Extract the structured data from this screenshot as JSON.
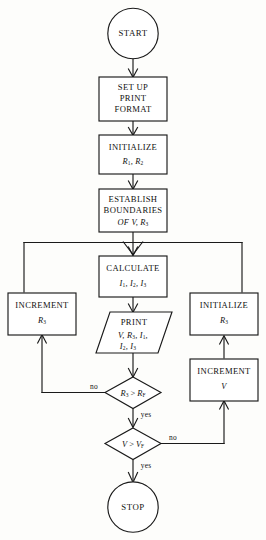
{
  "diagram": {
    "type": "flowchart",
    "stroke_color": "#1a1a1a",
    "fill_color": "#ffffff",
    "background_color": "#fdfdfb"
  },
  "nodes": {
    "start": {
      "shape": "terminal-circle",
      "label": "START"
    },
    "setup": {
      "shape": "process-rect",
      "line1": "SET UP",
      "line2": "PRINT",
      "line3": "FORMAT"
    },
    "initialize_r1_r2": {
      "shape": "process-rect",
      "line1": "INITIALIZE",
      "line2_prefix": "R",
      "line2_sub1": "1",
      "line2_mid": ", R",
      "line2_sub2": "2"
    },
    "establish": {
      "shape": "process-rect",
      "line1": "ESTABLISH",
      "line2": "BOUNDARIES",
      "line3_prefix": "OF V, R",
      "line3_sub": "3"
    },
    "calculate": {
      "shape": "process-rect",
      "line1": "CALCULATE",
      "line2_a": "I",
      "line2_a_sub": "1",
      "line2_b": ", I",
      "line2_b_sub": "2",
      "line2_c": ", I",
      "line2_c_sub": "3"
    },
    "print": {
      "shape": "parallelogram-io",
      "line1": "PRINT",
      "line2_a": "V, R",
      "line2_a_sub": "3",
      "line2_b": ", I",
      "line2_b_sub": "1",
      "line2_c": ",",
      "line3_a": "I",
      "line3_a_sub": "2",
      "line3_b": ", I",
      "line3_b_sub": "3"
    },
    "increment_r3": {
      "shape": "process-rect",
      "line1": "INCREMENT",
      "line2_prefix": "R",
      "line2_sub": "3"
    },
    "initialize_r3": {
      "shape": "process-rect",
      "line1": "INITIALIZE",
      "line2_prefix": "R",
      "line2_sub": "3"
    },
    "increment_v": {
      "shape": "process-rect",
      "line1": "INCREMENT",
      "line2": "V"
    },
    "decision_r": {
      "shape": "decision-diamond",
      "lhs": "R",
      "lhs_sub": "3",
      "op": " > ",
      "rhs": "R",
      "rhs_sub": "F"
    },
    "decision_v": {
      "shape": "decision-diamond",
      "lhs": "V",
      "op": " > ",
      "rhs": "V",
      "rhs_sub": "F"
    },
    "stop": {
      "shape": "terminal-circle",
      "label": "STOP"
    }
  },
  "edge_labels": {
    "r_no": "no",
    "r_yes": "yes",
    "v_no": "no",
    "v_yes": "yes"
  }
}
